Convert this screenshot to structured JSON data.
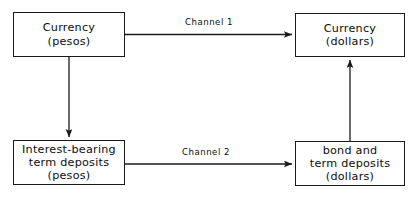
{
  "diagram": {
    "background_color": "#ffffff",
    "stroke_color": "#1a1a1a",
    "text_color": "#0d0d0d",
    "nodes": [
      {
        "id": "currency-pesos",
        "lines": [
          "Currency",
          "(pesos)"
        ],
        "line1": "Currency",
        "line2": "(pesos)",
        "line3": ""
      },
      {
        "id": "currency-dollars",
        "lines": [
          "Currency",
          "(dollars)"
        ],
        "line1": "Currency",
        "line2": "(dollars)",
        "line3": ""
      },
      {
        "id": "term-deposits-pesos",
        "lines": [
          "Interest-bearing",
          "term deposits",
          "(pesos)"
        ],
        "line1": "Interest-bearing",
        "line2": "term deposits",
        "line3": "(pesos)"
      },
      {
        "id": "bond-term-deposits-dollars",
        "lines": [
          "bond and",
          "term deposits",
          "(dollars)"
        ],
        "line1": "bond and",
        "line2": "term deposits",
        "line3": "(dollars)"
      }
    ],
    "edges": [
      {
        "id": "channel-1",
        "label": "Channel 1",
        "from": "currency-pesos",
        "to": "currency-dollars",
        "direction": "right"
      },
      {
        "id": "channel-2",
        "label": "Channel 2",
        "from": "term-deposits-pesos",
        "to": "bond-term-deposits-dollars",
        "direction": "right"
      },
      {
        "id": "peso-shift",
        "label": "",
        "from": "currency-pesos",
        "to": "term-deposits-pesos",
        "direction": "down"
      },
      {
        "id": "dollar-shift",
        "label": "",
        "from": "bond-term-deposits-dollars",
        "to": "currency-dollars",
        "direction": "up"
      }
    ]
  }
}
